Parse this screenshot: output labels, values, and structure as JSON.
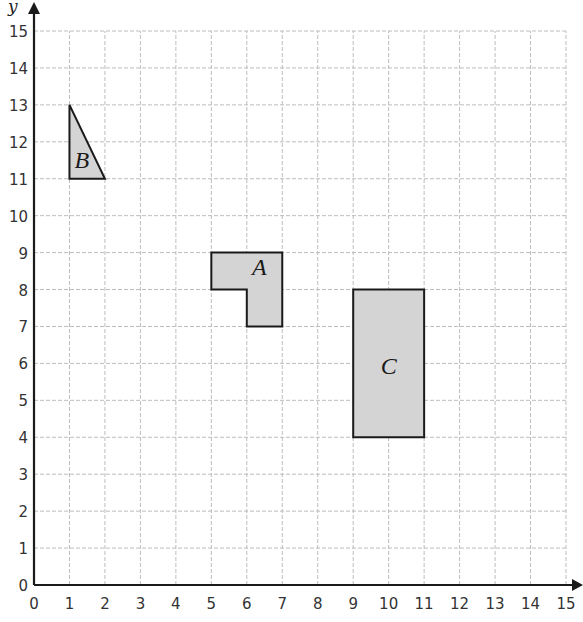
{
  "chart_data": {
    "type": "coordinate-grid",
    "title": "",
    "xlabel": "x",
    "ylabel": "y",
    "xlim": [
      0,
      15
    ],
    "ylim": [
      0,
      15
    ],
    "grid": true,
    "x_ticks": [
      "0",
      "1",
      "2",
      "3",
      "4",
      "5",
      "6",
      "7",
      "8",
      "9",
      "10",
      "11",
      "12",
      "13",
      "14",
      "15"
    ],
    "y_ticks": [
      "0",
      "1",
      "2",
      "3",
      "4",
      "5",
      "6",
      "7",
      "8",
      "9",
      "10",
      "11",
      "12",
      "13",
      "14",
      "15"
    ],
    "shapes": [
      {
        "name": "A",
        "type": "polygon",
        "label": "A",
        "vertices": [
          [
            5,
            9
          ],
          [
            7,
            9
          ],
          [
            7,
            7
          ],
          [
            6,
            7
          ],
          [
            6,
            8
          ],
          [
            5,
            8
          ]
        ],
        "label_pos": [
          6.35,
          8.4
        ]
      },
      {
        "name": "B",
        "type": "triangle",
        "label": "B",
        "vertices": [
          [
            1,
            13
          ],
          [
            1,
            11
          ],
          [
            2,
            11
          ]
        ],
        "label_pos": [
          1.35,
          11.3
        ]
      },
      {
        "name": "C",
        "type": "rectangle",
        "label": "C",
        "vertices": [
          [
            9,
            8
          ],
          [
            11,
            8
          ],
          [
            11,
            4
          ],
          [
            9,
            4
          ]
        ],
        "label_pos": [
          10,
          5.7
        ]
      }
    ],
    "colors": {
      "grid": "#bdbdbd",
      "axis": "#1a1a1a",
      "shape_fill": "#d4d4d4",
      "shape_stroke": "#1a1a1a"
    }
  }
}
